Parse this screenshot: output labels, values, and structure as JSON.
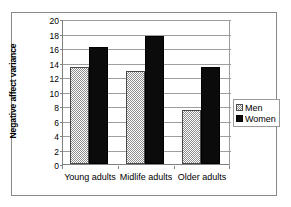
{
  "chart_data": {
    "type": "bar",
    "title": "",
    "xlabel": "",
    "ylabel": "Negative affect variance",
    "categories": [
      "Young adults",
      "Midlife adults",
      "Older adults"
    ],
    "series": [
      {
        "name": "Men",
        "values": [
          13.4,
          12.8,
          7.4
        ]
      },
      {
        "name": "Women",
        "values": [
          16.2,
          17.6,
          13.4
        ]
      }
    ],
    "ylim": [
      0,
      20
    ],
    "ytick_labels": [
      "0",
      "2",
      "4",
      "6",
      "8",
      "10",
      "12",
      "14",
      "16",
      "18",
      "20"
    ],
    "ytick_values": [
      0,
      2,
      4,
      6,
      8,
      10,
      12,
      14,
      16,
      18,
      20
    ],
    "grid": true,
    "legend_position": "right",
    "colors": {
      "men_pattern": "#8d8d8d",
      "women_fill": "#0b0b0b",
      "gridline": "#9e9e9e",
      "axis": "#808080",
      "frame": "#8a8a8a",
      "text": "#000000",
      "background": "#ffffff"
    }
  },
  "legend": {
    "entries": [
      {
        "label": "Men",
        "swatch": "hatched-swatch-icon"
      },
      {
        "label": "Women",
        "swatch": "solid-black-swatch-icon"
      }
    ]
  }
}
